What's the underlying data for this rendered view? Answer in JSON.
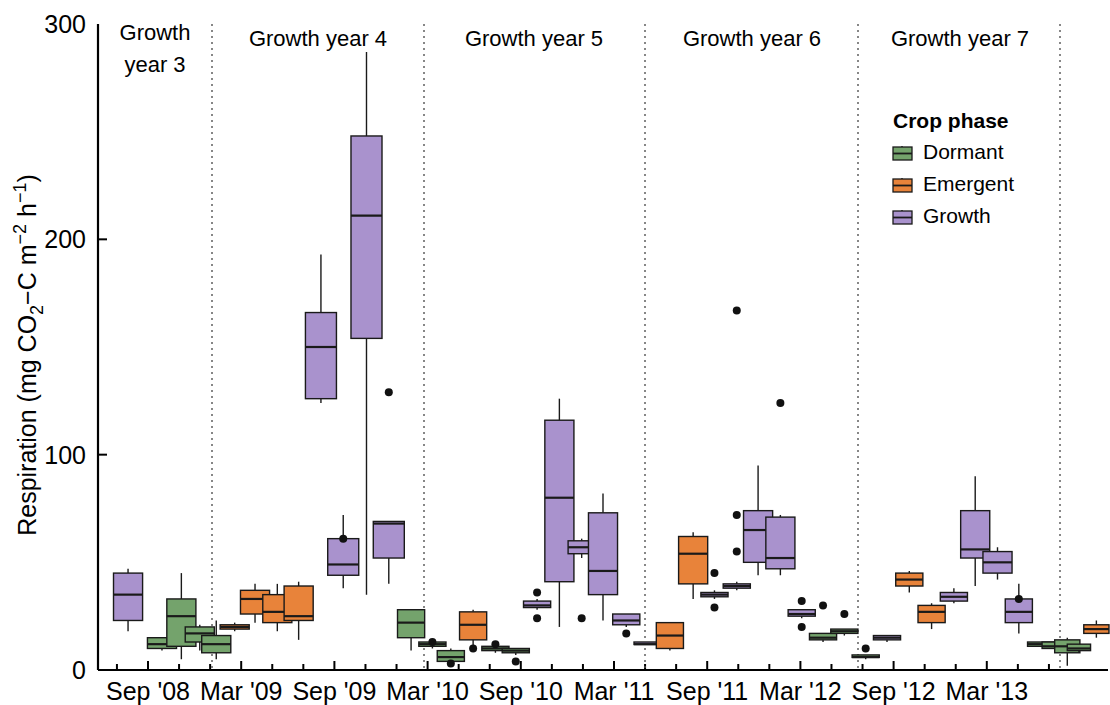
{
  "chart_data": {
    "type": "box",
    "title": "",
    "xlabel": "",
    "ylabel": "Respiration (mg CO2-C m-2 h-1)",
    "ylabel_parts": {
      "prefix": "Respiration (mg CO",
      "sub2": "2",
      "mid": "−C m",
      "sup_neg2": "−2",
      "mid2": " h",
      "sup_neg1": "−1",
      "suffix": ")"
    },
    "ylim": [
      0,
      300
    ],
    "yticks": [
      0,
      100,
      200,
      300
    ],
    "ytick_labels": [
      "0",
      "100",
      "200",
      "300"
    ],
    "xtick_labels": [
      "Sep '08",
      "Mar '09",
      "Sep '09",
      "Mar '10",
      "Sep '10",
      "Mar '11",
      "Sep '11",
      "Mar '12",
      "Sep '12",
      "Mar '13"
    ],
    "grid": false,
    "legend": {
      "title": "Crop phase",
      "position": "top-right",
      "entries": [
        {
          "label": "Dormant",
          "color": "#74a36c"
        },
        {
          "label": "Emergent",
          "color": "#e8833a"
        },
        {
          "label": "Growth",
          "color": "#a992cd"
        }
      ]
    },
    "panels": [
      {
        "label": "Growth year 3",
        "label_lines": [
          "Growth",
          "year 3"
        ]
      },
      {
        "label": "Growth year 4",
        "label_lines": [
          "Growth year 4"
        ]
      },
      {
        "label": "Growth year 5",
        "label_lines": [
          "Growth year 5"
        ]
      },
      {
        "label": "Growth year 6",
        "label_lines": [
          "Growth year 6"
        ]
      },
      {
        "label": "Growth year 7",
        "label_lines": [
          "Growth year 7"
        ]
      }
    ],
    "panel_dividers": [
      212,
      424,
      645,
      858,
      1060
    ],
    "boxes": [
      {
        "phase": "Growth",
        "x": 129,
        "w": 30,
        "min": 18,
        "q1": 23,
        "med": 35,
        "q3": 45,
        "max": 47,
        "outliers": []
      },
      {
        "phase": "Dormant",
        "x": 164,
        "w": 30,
        "min": 9,
        "q1": 10,
        "med": 12,
        "q3": 15,
        "max": 15,
        "outliers": []
      },
      {
        "phase": "Dormant",
        "x": 184,
        "w": 30,
        "min": 5,
        "q1": 11,
        "med": 25,
        "q3": 33,
        "max": 45,
        "outliers": []
      },
      {
        "phase": "Dormant",
        "x": 203,
        "w": 30,
        "min": 9,
        "q1": 13,
        "med": 17,
        "q3": 20,
        "max": 21,
        "outliers": []
      },
      {
        "phase": "Dormant",
        "x": 220,
        "w": 30,
        "min": 5,
        "q1": 8,
        "med": 12,
        "q3": 16,
        "max": 23,
        "outliers": []
      },
      {
        "phase": "Emergent",
        "x": 239,
        "w": 30,
        "min": 18,
        "q1": 19,
        "med": 20,
        "q3": 21,
        "max": 22,
        "outliers": []
      },
      {
        "phase": "Emergent",
        "x": 260,
        "w": 30,
        "min": 22,
        "q1": 26,
        "med": 33,
        "q3": 37,
        "max": 40,
        "outliers": []
      },
      {
        "phase": "Emergent",
        "x": 283,
        "w": 30,
        "min": 18,
        "q1": 22,
        "med": 27,
        "q3": 35,
        "max": 40,
        "outliers": []
      },
      {
        "phase": "Emergent",
        "x": 305,
        "w": 30,
        "min": 14,
        "q1": 23,
        "med": 25,
        "q3": 39,
        "max": 41,
        "outliers": []
      },
      {
        "phase": "Growth",
        "x": 328,
        "w": 32,
        "min": 124,
        "q1": 126,
        "med": 150,
        "q3": 166,
        "max": 193,
        "outliers": []
      },
      {
        "phase": "Growth",
        "x": 351,
        "w": 32,
        "min": 38,
        "q1": 44,
        "med": 49,
        "q3": 61,
        "max": 72,
        "outliers": [
          61
        ]
      },
      {
        "phase": "Growth",
        "x": 375,
        "w": 32,
        "min": 35,
        "q1": 154,
        "med": 211,
        "q3": 248,
        "max": 287,
        "outliers": []
      },
      {
        "phase": "Growth",
        "x": 398,
        "w": 32,
        "min": 40,
        "q1": 52,
        "med": 68,
        "q3": 69,
        "max": 69,
        "outliers": [
          129
        ]
      },
      {
        "phase": "Dormant",
        "x": 421,
        "w": 28,
        "min": 9,
        "q1": 15,
        "med": 22,
        "q3": 28,
        "max": 28,
        "outliers": []
      },
      {
        "phase": "Dormant",
        "x": 443,
        "w": 28,
        "min": 10,
        "q1": 11,
        "med": 12,
        "q3": 13,
        "max": 14,
        "outliers": [
          13
        ]
      },
      {
        "phase": "Dormant",
        "x": 462,
        "w": 28,
        "min": 2,
        "q1": 4,
        "med": 6,
        "q3": 9,
        "max": 10,
        "outliers": [
          3
        ]
      },
      {
        "phase": "Emergent",
        "x": 485,
        "w": 28,
        "min": 10,
        "q1": 14,
        "med": 21,
        "q3": 27,
        "max": 28,
        "outliers": [
          10
        ]
      },
      {
        "phase": "Dormant",
        "x": 508,
        "w": 28,
        "min": 8,
        "q1": 9,
        "med": 10,
        "q3": 11,
        "max": 12,
        "outliers": [
          12
        ]
      },
      {
        "phase": "Dormant",
        "x": 529,
        "w": 28,
        "min": 7,
        "q1": 8,
        "med": 9,
        "q3": 10,
        "max": 10,
        "outliers": [
          4
        ]
      },
      {
        "phase": "Growth",
        "x": 551,
        "w": 28,
        "min": 28,
        "q1": 29,
        "med": 30,
        "q3": 32,
        "max": 33,
        "outliers": [
          36,
          24
        ]
      },
      {
        "phase": "Growth",
        "x": 574,
        "w": 30,
        "min": 20,
        "q1": 41,
        "med": 80,
        "q3": 116,
        "max": 126,
        "outliers": []
      },
      {
        "phase": "Growth",
        "x": 597,
        "w": 28,
        "min": 52,
        "q1": 54,
        "med": 57,
        "q3": 60,
        "max": 61,
        "outliers": [
          24
        ]
      },
      {
        "phase": "Growth",
        "x": 619,
        "w": 30,
        "min": 23,
        "q1": 35,
        "med": 46,
        "q3": 73,
        "max": 82,
        "outliers": []
      },
      {
        "phase": "Growth",
        "x": 643,
        "w": 28,
        "min": 20,
        "q1": 21,
        "med": 23,
        "q3": 26,
        "max": 26,
        "outliers": [
          17
        ]
      },
      {
        "phase": "Growth",
        "x": 665,
        "w": 28,
        "min": 12,
        "q1": 12,
        "med": 12,
        "q3": 13,
        "max": 13,
        "outliers": []
      },
      {
        "phase": "Emergent",
        "x": 688,
        "w": 28,
        "min": 9,
        "q1": 10,
        "med": 16,
        "q3": 22,
        "max": 22,
        "outliers": []
      },
      {
        "phase": "Emergent",
        "x": 712,
        "w": 30,
        "min": 33,
        "q1": 40,
        "med": 54,
        "q3": 62,
        "max": 64,
        "outliers": []
      },
      {
        "phase": "Growth",
        "x": 734,
        "w": 28,
        "min": 33,
        "q1": 34,
        "med": 35,
        "q3": 36,
        "max": 37,
        "outliers": [
          45,
          29
        ]
      },
      {
        "phase": "Growth",
        "x": 757,
        "w": 28,
        "min": 37,
        "q1": 38,
        "med": 39,
        "q3": 40,
        "max": 41,
        "outliers": [
          72,
          55,
          167
        ]
      },
      {
        "phase": "Growth",
        "x": 779,
        "w": 30,
        "min": 44,
        "q1": 50,
        "med": 65,
        "q3": 74,
        "max": 95,
        "outliers": []
      },
      {
        "phase": "Growth",
        "x": 802,
        "w": 30,
        "min": 44,
        "q1": 47,
        "med": 52,
        "q3": 71,
        "max": 72,
        "outliers": [
          124
        ]
      },
      {
        "phase": "Growth",
        "x": 824,
        "w": 28,
        "min": 24,
        "q1": 25,
        "med": 26,
        "q3": 28,
        "max": 28,
        "outliers": [
          32,
          20
        ]
      },
      {
        "phase": "Dormant",
        "x": 846,
        "w": 28,
        "min": 13,
        "q1": 14,
        "med": 15,
        "q3": 17,
        "max": 17,
        "outliers": [
          30
        ]
      },
      {
        "phase": "Dormant",
        "x": 868,
        "w": 28,
        "min": 16,
        "q1": 17,
        "med": 18,
        "q3": 19,
        "max": 19,
        "outliers": [
          26
        ]
      },
      {
        "phase": "Dormant",
        "x": 890,
        "w": 28,
        "min": 5,
        "q1": 6,
        "med": 6,
        "q3": 7,
        "max": 7,
        "outliers": [
          10
        ]
      },
      {
        "phase": "Growth",
        "x": 912,
        "w": 28,
        "min": 13,
        "q1": 14,
        "med": 15,
        "q3": 16,
        "max": 16,
        "outliers": []
      },
      {
        "phase": "Emergent",
        "x": 935,
        "w": 28,
        "min": 36,
        "q1": 39,
        "med": 42,
        "q3": 45,
        "max": 46,
        "outliers": []
      },
      {
        "phase": "Emergent",
        "x": 958,
        "w": 28,
        "min": 19,
        "q1": 22,
        "med": 27,
        "q3": 30,
        "max": 31,
        "outliers": []
      },
      {
        "phase": "Growth",
        "x": 981,
        "w": 28,
        "min": 31,
        "q1": 32,
        "med": 34,
        "q3": 36,
        "max": 38,
        "outliers": []
      },
      {
        "phase": "Growth",
        "x": 1003,
        "w": 30,
        "min": 39,
        "q1": 52,
        "med": 56,
        "q3": 74,
        "max": 90,
        "outliers": []
      },
      {
        "phase": "Growth",
        "x": 1026,
        "w": 30,
        "min": 42,
        "q1": 45,
        "med": 50,
        "q3": 55,
        "max": 57,
        "outliers": []
      },
      {
        "phase": "Growth",
        "x": 1048,
        "w": 28,
        "min": 17,
        "q1": 22,
        "med": 27,
        "q3": 33,
        "max": 40,
        "outliers": [
          33
        ]
      },
      {
        "phase": "Dormant",
        "x": 1071,
        "w": 28,
        "min": 11,
        "q1": 11,
        "med": 12,
        "q3": 13,
        "max": 13,
        "outliers": []
      },
      {
        "phase": "Dormant",
        "x": 1085,
        "w": 26,
        "min": 9,
        "q1": 10,
        "med": 11,
        "q3": 13,
        "max": 14,
        "outliers": []
      },
      {
        "phase": "Dormant",
        "x": 1098,
        "w": 26,
        "min": 2,
        "q1": 8,
        "med": 11,
        "q3": 14,
        "max": 15,
        "outliers": []
      },
      {
        "phase": "Dormant",
        "x": 1110,
        "w": 24,
        "min": 8,
        "q1": 9,
        "med": 10,
        "q3": 12,
        "max": 12,
        "outliers": []
      },
      {
        "phase": "Emergent",
        "x": 1128,
        "w": 26,
        "min": 15,
        "q1": 17,
        "med": 19,
        "q3": 21,
        "max": 23,
        "outliers": []
      }
    ]
  }
}
